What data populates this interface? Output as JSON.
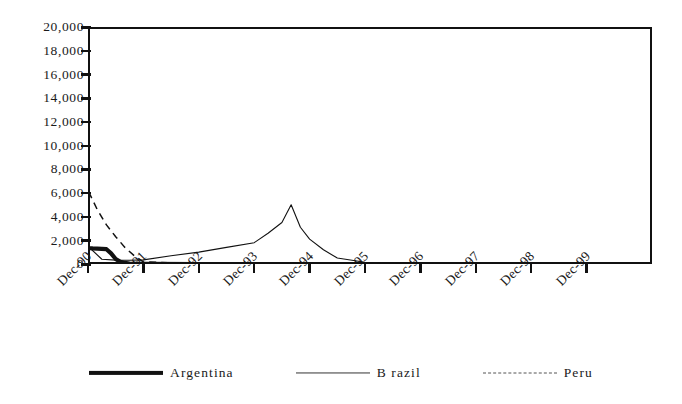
{
  "chart_data": {
    "type": "line",
    "title": "",
    "subtitle": "",
    "xlabel": "",
    "ylabel": "",
    "ylim": [
      0,
      20000
    ],
    "y_ticks": [
      "0",
      "2,000",
      "4,000",
      "6,000",
      "8,000",
      "10,000",
      "12,000",
      "14,000",
      "16,000",
      "18,000",
      "20,000"
    ],
    "y_tick_values": [
      0,
      2000,
      4000,
      6000,
      8000,
      10000,
      12000,
      14000,
      16000,
      18000,
      20000
    ],
    "grid": false,
    "legend_position": "bottom",
    "x_tick_labels": [
      "Dec-90",
      "Dec-91",
      "Dec-92",
      "Dec-93",
      "Dec-94",
      "Dec-95",
      "Dec-96",
      "Dec-97",
      "Dec-98",
      "Dec-99"
    ],
    "x_tick_rotation_degrees": -45,
    "x_axis_note": "monthly observations spanning Jan-1990 through Dec-1999",
    "x_range_start": "Jan-90",
    "x_range_end": "Dec-99",
    "series": [
      {
        "name": "Argentina",
        "line_style": "solid",
        "line_width": "thick",
        "color": "#111111",
        "peak_value": 20000,
        "peak_label": "Dec-90",
        "note": "peak is clipped at the 20,000 axis maximum",
        "x": [
          "Jan-90",
          "Feb-90",
          "Mar-90",
          "Apr-90",
          "May-90",
          "Jun-90",
          "Jul-90",
          "Aug-90",
          "Sep-90",
          "Oct-90",
          "Nov-90",
          "Dec-90",
          "Jan-91",
          "Feb-91",
          "Mar-91",
          "Apr-91",
          "May-91",
          "Jun-91",
          "Jul-91",
          "Aug-91",
          "Sep-91",
          "Oct-91",
          "Nov-91",
          "Dec-91",
          "Dec-92",
          "Dec-93",
          "Dec-94",
          "Dec-95",
          "Dec-96",
          "Dec-97",
          "Dec-98",
          "Dec-99"
        ],
        "values": [
          7900,
          8400,
          20000,
          20000,
          15500,
          11000,
          7000,
          4200,
          2600,
          1900,
          1500,
          1350,
          1320,
          1300,
          1280,
          1250,
          900,
          420,
          180,
          90,
          40,
          20,
          10,
          5,
          0,
          0,
          0,
          0,
          0,
          0,
          0,
          0
        ]
      },
      {
        "name": "Brazil",
        "line_style": "solid",
        "line_width": "thin",
        "color": "#333333",
        "peak_value": 6700,
        "peak_label": "Jun-90",
        "secondary_peak_value": 5000,
        "secondary_peak_label": "Aug-94",
        "x": [
          "Jan-90",
          "Feb-90",
          "Mar-90",
          "Apr-90",
          "May-90",
          "Jun-90",
          "Jul-90",
          "Aug-90",
          "Sep-90",
          "Oct-90",
          "Nov-90",
          "Dec-90",
          "Mar-91",
          "Jun-91",
          "Sep-91",
          "Dec-91",
          "Jun-92",
          "Dec-92",
          "Jun-93",
          "Dec-93",
          "Mar-94",
          "Jun-94",
          "Aug-94",
          "Oct-94",
          "Dec-94",
          "Mar-95",
          "Jun-95",
          "Dec-95",
          "Dec-96",
          "Dec-97",
          "Dec-98",
          "Dec-99"
        ],
        "values": [
          2000,
          2050,
          2100,
          3400,
          5600,
          6700,
          6300,
          4600,
          2700,
          1700,
          1450,
          1500,
          400,
          330,
          320,
          350,
          700,
          1000,
          1400,
          1800,
          2600,
          3500,
          5000,
          3100,
          2100,
          1200,
          500,
          150,
          40,
          20,
          10,
          5
        ]
      },
      {
        "name": "Peru",
        "line_style": "dashed",
        "line_width": "thin",
        "color": "#555555",
        "peak_value": 12500,
        "peak_label": "Aug-90",
        "shoulder_value": 8000,
        "shoulder_label": "Oct-90",
        "x": [
          "Jun-90",
          "Jul-90",
          "Aug-90",
          "Sep-90",
          "Oct-90",
          "Nov-90",
          "Dec-90",
          "Feb-91",
          "Apr-91",
          "Jun-91",
          "Aug-91",
          "Oct-91",
          "Dec-91",
          "Dec-92",
          "Dec-93",
          "Dec-94",
          "Dec-95",
          "Dec-96",
          "Dec-97",
          "Dec-98",
          "Dec-99"
        ],
        "values": [
          0,
          5200,
          12500,
          9400,
          8000,
          7600,
          6200,
          4600,
          3300,
          2300,
          1400,
          700,
          180,
          0,
          0,
          0,
          0,
          0,
          0,
          0,
          0
        ]
      }
    ]
  },
  "legend": {
    "items": [
      {
        "label": "Argentina",
        "swatch": "thick-solid-line-swatch"
      },
      {
        "label": "B razil",
        "swatch": "thin-solid-line-swatch"
      },
      {
        "label": "Peru",
        "swatch": "dashed-line-swatch"
      }
    ]
  },
  "colors": {
    "ink": "#111111",
    "background": "#ffffff"
  }
}
